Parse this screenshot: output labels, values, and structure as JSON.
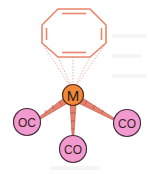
{
  "diagram": {
    "ring": {
      "name": "cyclooctatetraene",
      "color": "#e8856a",
      "vertices": [
        [
          58,
          9
        ],
        [
          90,
          9
        ],
        [
          106,
          25
        ],
        [
          106,
          43
        ],
        [
          90,
          57
        ],
        [
          58,
          57
        ],
        [
          42,
          43
        ],
        [
          42,
          25
        ]
      ],
      "double_bond_edges": [
        0,
        2,
        4,
        6
      ]
    },
    "metal": {
      "label": "M",
      "cx": 73,
      "cy": 95,
      "r": 10,
      "fill": "#f0883a",
      "stroke": "#5a2a1a"
    },
    "ligands": [
      {
        "label": "OC",
        "cx": 27,
        "cy": 122,
        "r": 14
      },
      {
        "label": "CO",
        "cx": 73,
        "cy": 149,
        "r": 14
      },
      {
        "label": "CO",
        "cx": 127,
        "cy": 123,
        "r": 14
      }
    ],
    "ligand_fill": "#f09ad0",
    "ligand_stroke": "#4a2a3a",
    "bond_color": "#e8806e"
  }
}
